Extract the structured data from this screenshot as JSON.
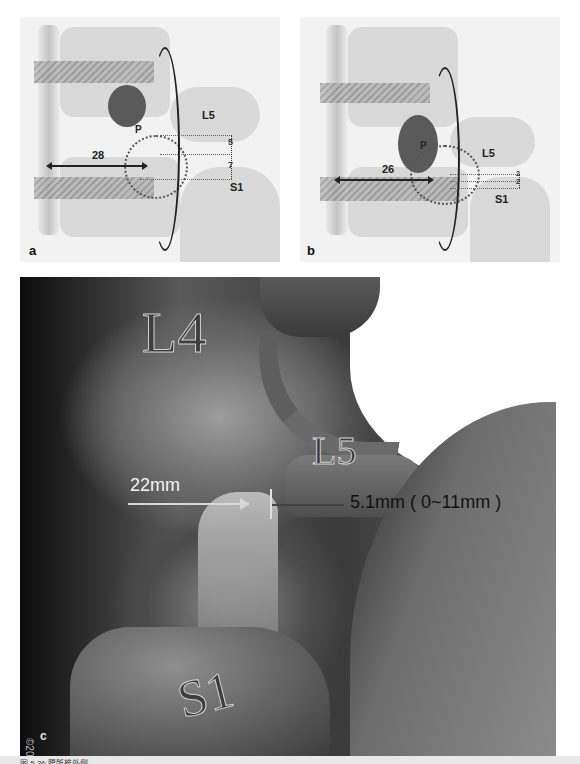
{
  "figure": {
    "panels": [
      {
        "id": "a",
        "letter": "a",
        "labels": {
          "upper_vertebra": "L5",
          "lower_vertebra": "S1",
          "pedicle": "P"
        },
        "horizontal_measure": "28",
        "vertical_measures": [
          "5",
          "7"
        ]
      },
      {
        "id": "b",
        "letter": "b",
        "labels": {
          "upper_vertebra": "L5",
          "lower_vertebra": "S1",
          "pedicle": "P"
        },
        "horizontal_measure": "26",
        "vertical_measures": [
          "2",
          "2"
        ]
      },
      {
        "id": "c",
        "letter": "c",
        "labels": {
          "l4": "L4",
          "l5": "L5",
          "s1": "S1"
        },
        "horizontal_measure": "22mm",
        "vertical_measure": "5.1mm ( 0~11mm )",
        "copyright": "©2019 Barrow"
      }
    ],
    "caption_partial": "图 5.36  腰骶椎外侧..."
  },
  "colors": {
    "background": "#ffffff",
    "render_dark": "#0c0c0c",
    "label_light": "#f3f3f3",
    "label_dark": "#111111"
  }
}
